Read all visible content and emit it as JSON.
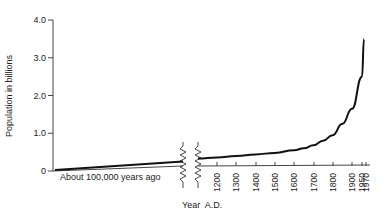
{
  "chart_data": {
    "type": "line",
    "title": "",
    "xlabel": "Year  A.D.",
    "ylabel": "Population in billions",
    "ylim": [
      0,
      4.0
    ],
    "yticks": [
      "0",
      "1.0",
      "2.0",
      "3.0",
      "4.0"
    ],
    "xticks": [
      "1200",
      "1300",
      "1400",
      "1500",
      "1600",
      "1700",
      "1800",
      "1900",
      "1950",
      "1970"
    ],
    "annotations": [
      "About 100,000 years ago"
    ],
    "axis_break": true,
    "grid": false,
    "legend": "none",
    "series": [
      {
        "name": "World population (prehistoric segment)",
        "x": [
          "About 100,000 years ago",
          "~1100"
        ],
        "values": [
          0.0,
          0.25
        ]
      },
      {
        "name": "World population (A.D.)",
        "x": [
          1150,
          1200,
          1300,
          1400,
          1500,
          1600,
          1650,
          1700,
          1750,
          1800,
          1850,
          1900,
          1950,
          1970
        ],
        "values": [
          0.33,
          0.36,
          0.4,
          0.44,
          0.48,
          0.55,
          0.6,
          0.68,
          0.8,
          0.95,
          1.25,
          1.65,
          2.5,
          3.5
        ]
      }
    ]
  },
  "labels": {
    "ylabel": "Population in billions",
    "xlabel": "Year  A.D.",
    "prehistoric_note": "About 100,000 years ago"
  }
}
